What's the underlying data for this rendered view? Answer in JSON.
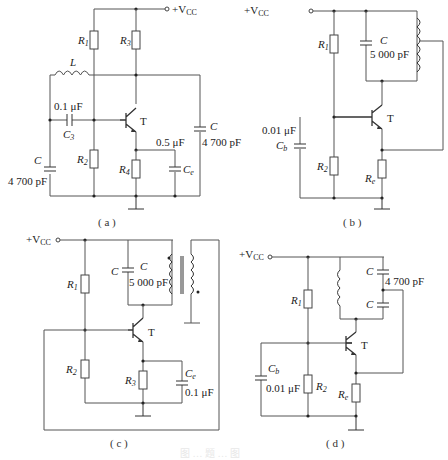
{
  "figure": {
    "caption": "图  …  题  …  图",
    "panels": {
      "a": {
        "label": "( a )",
        "supply": "+V",
        "supply_sub": "CC",
        "R1": "R",
        "R1_sub": "1",
        "R2": "R",
        "R2_sub": "2",
        "R3": "R",
        "R3_sub": "3",
        "R4": "R",
        "R4_sub": "4",
        "L": "L",
        "C3_value": "0.1 μF",
        "C3": "C",
        "C3_sub": "3",
        "transistor": "T",
        "Ce_value": "0.5 μF",
        "Ce": "C",
        "Ce_sub": "e",
        "C_left": "C",
        "C_left_value": "4 700 pF",
        "C_right": "C",
        "C_right_value": "4 700 pF"
      },
      "b": {
        "label": "( b )",
        "supply": "+V",
        "supply_sub": "CC",
        "R1": "R",
        "R1_sub": "1",
        "R2": "R",
        "R2_sub": "2",
        "Re": "R",
        "Re_sub": "e",
        "C": "C",
        "C_value": "5 000 pF",
        "Cb_value": "0.01 μF",
        "Cb": "C",
        "Cb_sub": "b",
        "transistor": "T"
      },
      "c": {
        "label": "( c )",
        "supply": "+V",
        "supply_sub": "CC",
        "R1": "R",
        "R1_sub": "1",
        "R2": "R",
        "R2_sub": "2",
        "R3": "R",
        "R3_sub": "3",
        "C_a": "C",
        "C_b": "C",
        "C_value": "5 000 pF",
        "Ce": "C",
        "Ce_sub": "e",
        "Ce_value": "0.1 μF",
        "transistor": "T"
      },
      "d": {
        "label": "( d )",
        "supply": "+V",
        "supply_sub": "CC",
        "R1": "R",
        "R1_sub": "1",
        "R2": "R",
        "R2_sub": "2",
        "Re": "R",
        "Re_sub": "e",
        "C_top": "C",
        "C_value": "4 700 pF",
        "C_bottom": "C",
        "Cb": "C",
        "Cb_sub": "b",
        "Cb_value": "0.01 μF",
        "transistor": "T"
      }
    }
  }
}
